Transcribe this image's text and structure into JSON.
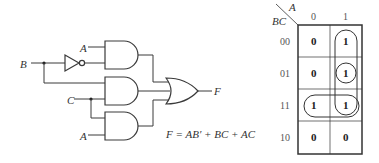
{
  "circuit": {
    "inputs": {
      "b": "B",
      "a_top": "A",
      "c": "C",
      "a_bottom": "A"
    },
    "output": "F",
    "gates": [
      {
        "type": "NOT",
        "input": "B",
        "output": "B'"
      },
      {
        "type": "AND",
        "inputs": [
          "A",
          "B'"
        ],
        "output": "AB'"
      },
      {
        "type": "AND",
        "inputs": [
          "B",
          "C"
        ],
        "output": "BC"
      },
      {
        "type": "AND",
        "inputs": [
          "C",
          "A"
        ],
        "output": "AC"
      },
      {
        "type": "OR",
        "inputs": [
          "AB'",
          "BC",
          "AC"
        ],
        "output": "F"
      }
    ],
    "equation": "F = AB′ + BC + AC"
  },
  "kmap": {
    "row_var": "BC",
    "col_var": "A",
    "col_headers": [
      "0",
      "1"
    ],
    "row_headers": [
      "00",
      "01",
      "11",
      "10"
    ],
    "cells": [
      [
        "0",
        "1"
      ],
      [
        "0",
        "1"
      ],
      [
        "1",
        "1"
      ],
      [
        "0",
        "0"
      ]
    ],
    "groupings": [
      {
        "cells": "A=1, BC=00..11",
        "shape": "vertical loop"
      },
      {
        "cells": "A=1, BC=01",
        "shape": "circle"
      },
      {
        "cells": "BC=11, A=0..1",
        "shape": "horizontal loop"
      }
    ]
  }
}
